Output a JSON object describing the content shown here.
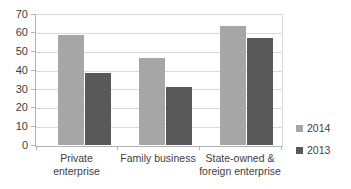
{
  "chart_data": {
    "type": "bar",
    "title": "",
    "xlabel": "",
    "ylabel": "",
    "categories": [
      "Private enterprise",
      "Family business",
      "State-owned &\nforeign enterprise"
    ],
    "series": [
      {
        "name": "2014",
        "color": "#a6a6a6",
        "values": [
          59,
          47,
          64
        ]
      },
      {
        "name": "2013",
        "color": "#595959",
        "values": [
          39,
          31,
          57.5
        ]
      }
    ],
    "ylim": [
      0,
      70
    ],
    "ytick_step": 10,
    "yticks": [
      "70",
      "60",
      "50",
      "40",
      "30",
      "20",
      "10",
      "0"
    ],
    "grid": "horizontal",
    "legend_position": "right"
  },
  "legend": {
    "items": [
      {
        "label": "2014",
        "color": "#a6a6a6"
      },
      {
        "label": "2013",
        "color": "#595959"
      }
    ]
  },
  "axis": {
    "y_labels": [
      "70",
      "60",
      "50",
      "40",
      "30",
      "20",
      "10",
      "0"
    ]
  },
  "categories": {
    "c0": "Private enterprise",
    "c1": "Family business",
    "c2": "State-owned &\nforeign enterprise"
  }
}
